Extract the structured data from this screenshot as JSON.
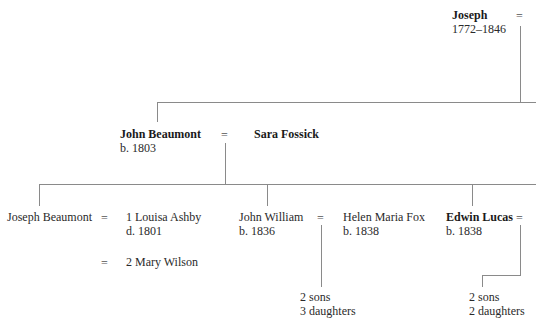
{
  "tree": {
    "gen1": {
      "joseph": {
        "name": "Joseph",
        "dates": "1772–1846",
        "marriage_symbol": "="
      }
    },
    "gen2": {
      "john_beaumont": {
        "name": "John Beaumont",
        "dates": "b. 1803",
        "marriage_symbol": "="
      },
      "sara_fossick": {
        "name": "Sara Fossick"
      }
    },
    "gen3": {
      "joseph_beaumont": {
        "name": "Joseph Beaumont",
        "marriage_symbol_1": "=",
        "marriage_symbol_2": "="
      },
      "louisa_ashby": {
        "name": "1 Louisa Ashby",
        "dates": "d. 1801"
      },
      "mary_wilson": {
        "name": "2 Mary Wilson"
      },
      "john_william": {
        "name": "John William",
        "dates": "b. 1836",
        "marriage_symbol": "="
      },
      "helen_maria_fox": {
        "name": "Helen Maria Fox",
        "dates": "b. 1838"
      },
      "edwin_lucas": {
        "name": "Edwin Lucas",
        "dates": "b. 1838",
        "marriage_symbol": "="
      }
    },
    "gen4": {
      "john_william_children": {
        "sons": "2 sons",
        "daughters": "3 daughters"
      },
      "edwin_lucas_children": {
        "sons": "2 sons",
        "daughters": "2 daughters"
      }
    }
  },
  "colors": {
    "line": "#8a8a8a",
    "text": "#2a2a2a"
  }
}
